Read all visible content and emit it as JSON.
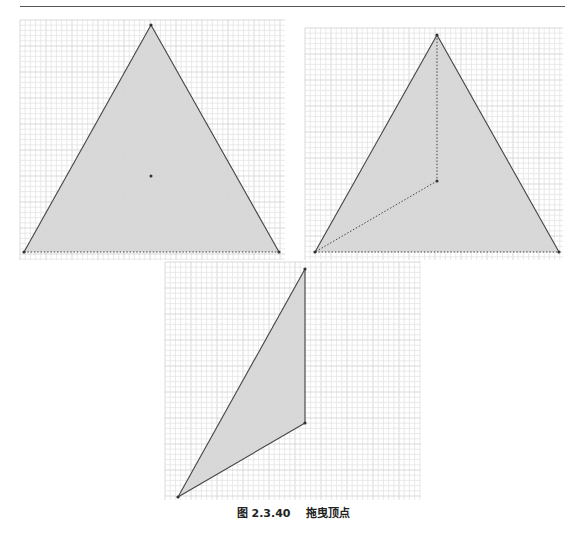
{
  "page": {
    "header_text": "",
    "caption": {
      "figure_number": "图 2.3.40",
      "title": "拖曳顶点"
    }
  },
  "colors": {
    "grid_minor": "#e4e4e4",
    "grid_major": "#cfcfcf",
    "fill": "#d6d6d6",
    "stroke": "#444444",
    "point": "#333333"
  },
  "figures": [
    {
      "name": "equilateral-triangle",
      "grid": {
        "x": 20,
        "y": 20,
        "w": 265,
        "h": 240
      },
      "vertices": [
        [
          151,
          25
        ],
        [
          24,
          252
        ],
        [
          279,
          252
        ]
      ],
      "dotted_edges": [
        [
          [
            24,
            252
          ],
          [
            279,
            252
          ]
        ]
      ],
      "inner_point": [
        151,
        176
      ]
    },
    {
      "name": "triangle-with-inner-point",
      "grid": {
        "x": 305,
        "y": 28,
        "w": 258,
        "h": 232
      },
      "vertices": [
        [
          437,
          35
        ],
        [
          315,
          252
        ],
        [
          559,
          252
        ]
      ],
      "dotted_edges": [
        [
          [
            315,
            252
          ],
          [
            559,
            252
          ]
        ],
        [
          [
            437,
            35
          ],
          [
            437,
            181
          ]
        ],
        [
          [
            437,
            181
          ],
          [
            315,
            252
          ]
        ]
      ],
      "inner_point": [
        437,
        181
      ]
    },
    {
      "name": "dragged-vertex-triangle",
      "grid": {
        "x": 165,
        "y": 262,
        "w": 256,
        "h": 238
      },
      "vertices": [
        [
          305,
          269
        ],
        [
          305,
          423
        ],
        [
          178,
          497
        ]
      ],
      "dotted_edges": [],
      "inner_point": null
    }
  ]
}
